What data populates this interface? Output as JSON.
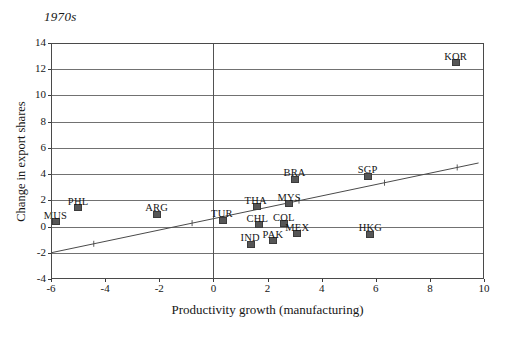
{
  "chart_data": {
    "type": "scatter",
    "title": "1970s",
    "xlabel": "Productivity growth (manufacturing)",
    "ylabel": "Change in export shares",
    "xlim": [
      -6,
      10
    ],
    "ylim": [
      -4,
      14
    ],
    "xticks": [
      -6,
      -4,
      -2,
      0,
      2,
      4,
      6,
      8,
      10
    ],
    "yticks": [
      -4,
      -2,
      0,
      2,
      4,
      6,
      8,
      10,
      12,
      14
    ],
    "grid": "horizontal gridlines plus vertical line at x=0",
    "legend": "none",
    "marker_color": "#565656",
    "trendline": {
      "type": "linear fit",
      "x_start": -6,
      "y_start": -2.0,
      "x_end": 9.8,
      "y_end": 4.85
    },
    "points": [
      {
        "label": "MUS",
        "x": -5.8,
        "y": 0.35,
        "label_dx": -1,
        "label_dy": -12
      },
      {
        "label": "PHL",
        "x": -5.0,
        "y": 1.45,
        "label_dx": 0,
        "label_dy": -12
      },
      {
        "label": "ARG",
        "x": -2.1,
        "y": 0.95,
        "label_dx": 0,
        "label_dy": -12
      },
      {
        "label": "TUR",
        "x": 0.35,
        "y": 0.5,
        "label_dx": -1,
        "label_dy": -12
      },
      {
        "label": "THA",
        "x": 1.6,
        "y": 1.5,
        "label_dx": -1,
        "label_dy": -12
      },
      {
        "label": "MYS",
        "x": 2.8,
        "y": 1.75,
        "label_dx": 0,
        "label_dy": -12
      },
      {
        "label": "CHL",
        "x": 1.7,
        "y": 0.15,
        "label_dx": -2,
        "label_dy": -12
      },
      {
        "label": "COL",
        "x": 2.6,
        "y": 0.2,
        "label_dx": 0,
        "label_dy": -12
      },
      {
        "label": "IND",
        "x": 1.4,
        "y": -1.35,
        "label_dx": -1,
        "label_dy": -12
      },
      {
        "label": "PAK",
        "x": 2.2,
        "y": -1.1,
        "label_dx": 0,
        "label_dy": -12
      },
      {
        "label": "MEX",
        "x": 3.1,
        "y": -0.55,
        "label_dx": 0,
        "label_dy": -12
      },
      {
        "label": "HKG",
        "x": 5.8,
        "y": -0.6,
        "label_dx": 0,
        "label_dy": -12
      },
      {
        "label": "BRA",
        "x": 3.0,
        "y": 3.6,
        "label_dx": 0,
        "label_dy": -12
      },
      {
        "label": "SGP",
        "x": 5.7,
        "y": 3.8,
        "label_dx": 0,
        "label_dy": -13
      },
      {
        "label": "KOR",
        "x": 8.95,
        "y": 12.5,
        "label_dx": 0,
        "label_dy": -12
      }
    ]
  }
}
